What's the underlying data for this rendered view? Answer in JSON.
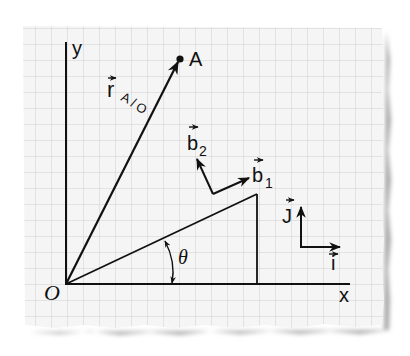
{
  "figure": {
    "type": "vector-diagram-on-graph-paper",
    "paper_color": "#f4f4f4",
    "grid_color": "#d2d2d2",
    "ink_color": "#111111",
    "shadow_color": "#9a9a9a"
  },
  "axes": {
    "x_label": "x",
    "y_label": "y",
    "origin_label": "O"
  },
  "point": {
    "label": "A"
  },
  "position_vector": {
    "symbol": "r",
    "subscript": "A/O",
    "sub_a": "A",
    "sub_slash": "/",
    "sub_o": "O"
  },
  "body_frame": {
    "b1_symbol": "b",
    "b1_subscript": "1",
    "b2_symbol": "b",
    "b2_subscript": "2"
  },
  "inertial_frame": {
    "i_symbol": "i",
    "j_symbol": "J"
  },
  "angle": {
    "label": "θ"
  }
}
